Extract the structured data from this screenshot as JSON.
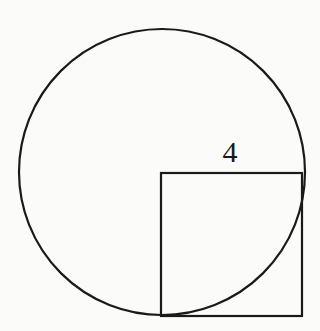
{
  "diagram": {
    "canvas": {
      "width": 320,
      "height": 331,
      "background": "#fbfbfa"
    },
    "stroke_color": "#1a1a1a",
    "circle": {
      "cx": 162,
      "cy": 172,
      "r": 143
    },
    "square": {
      "x": 161,
      "y": 173,
      "width": 141,
      "height": 143
    },
    "labels": [
      {
        "id": "side-length",
        "text": "4",
        "x": 230,
        "y": 162
      }
    ]
  }
}
